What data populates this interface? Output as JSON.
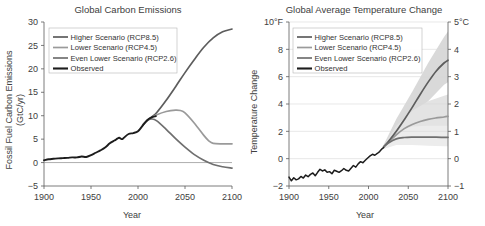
{
  "figure": {
    "panels": [
      {
        "id": "carbon-emissions",
        "title": "Global Carbon Emissions",
        "xlabel": "Year",
        "ylabel_line1": "Fossil Fuel Carbon Emissions",
        "ylabel_line2": "(GtC/yr)"
      },
      {
        "id": "temperature-change",
        "title": "Global Average Temperature Change",
        "xlabel": "Year",
        "ylabel_line1": "Temperature Change",
        "ylabel_line2": ""
      }
    ],
    "legend_entries": [
      {
        "label": "Higher Scenario (RCP8.5)",
        "color": "#5d5d5d"
      },
      {
        "label": "Lower Scenario (RCP4.5)",
        "color": "#9a9a9a"
      },
      {
        "label": "Even Lower Scenario (RCP2.6)",
        "color": "#6f6f6f"
      },
      {
        "label": "Observed",
        "color": "#1c1c1c"
      }
    ]
  },
  "chart_data": [
    {
      "type": "line",
      "id": "carbon-emissions",
      "title": "Global Carbon Emissions",
      "xlabel": "Year",
      "ylabel": "Fossil Fuel Carbon Emissions (GtC/yr)",
      "xlim": [
        1900,
        2100
      ],
      "ylim": [
        -5,
        30
      ],
      "xticks": [
        1900,
        1950,
        2000,
        2050,
        2100
      ],
      "yticks": [
        -5,
        0,
        5,
        10,
        15,
        20,
        25,
        30
      ],
      "ytick_labels": [
        "−5",
        "0",
        "5",
        "10",
        "15",
        "20",
        "25",
        "30"
      ],
      "grid": false,
      "legend_position": "top-left",
      "series": [
        {
          "name": "Observed",
          "color": "#1c1c1c",
          "width": 1.9,
          "x": [
            1900,
            1905,
            1910,
            1915,
            1920,
            1925,
            1930,
            1935,
            1940,
            1945,
            1950,
            1955,
            1960,
            1965,
            1970,
            1975,
            1978,
            1980,
            1983,
            1985,
            1990,
            1995,
            2000,
            2005,
            2010,
            2015,
            2019
          ],
          "y": [
            0.5,
            0.7,
            0.8,
            0.9,
            0.95,
            1.0,
            1.1,
            1.1,
            1.3,
            1.2,
            1.6,
            2.1,
            2.6,
            3.2,
            4.1,
            4.7,
            5.1,
            5.3,
            5.0,
            5.3,
            6.1,
            6.3,
            6.7,
            7.9,
            9.1,
            9.7,
            9.9
          ]
        },
        {
          "name": "Higher Scenario (RCP8.5)",
          "color": "#5d5d5d",
          "width": 1.7,
          "x": [
            2005,
            2010,
            2015,
            2020,
            2030,
            2040,
            2050,
            2060,
            2070,
            2080,
            2090,
            2100
          ],
          "y": [
            8.0,
            9.0,
            9.8,
            10.7,
            13.3,
            16.2,
            19.2,
            22.0,
            24.6,
            26.6,
            27.9,
            28.5
          ]
        },
        {
          "name": "Lower Scenario (RCP4.5)",
          "color": "#9a9a9a",
          "width": 1.7,
          "x": [
            2005,
            2010,
            2015,
            2020,
            2030,
            2040,
            2045,
            2050,
            2060,
            2070,
            2075,
            2080,
            2090,
            2100
          ],
          "y": [
            8.0,
            9.0,
            9.6,
            10.2,
            10.9,
            11.2,
            11.1,
            10.6,
            8.4,
            5.8,
            4.7,
            4.1,
            4.0,
            4.0
          ]
        },
        {
          "name": "Even Lower Scenario (RCP2.6)",
          "color": "#6f6f6f",
          "width": 1.7,
          "x": [
            2005,
            2010,
            2015,
            2020,
            2030,
            2040,
            2050,
            2060,
            2070,
            2080,
            2090,
            2100
          ],
          "y": [
            8.0,
            9.0,
            9.3,
            8.9,
            7.1,
            5.1,
            3.3,
            1.7,
            0.5,
            -0.4,
            -0.9,
            -1.2
          ]
        }
      ]
    },
    {
      "type": "line",
      "id": "temperature-change",
      "title": "Global Average Temperature Change",
      "xlabel": "Year",
      "ylabel": "Temperature Change",
      "xlim": [
        1900,
        2100
      ],
      "ylim_f": [
        -2,
        10
      ],
      "ylim_c": [
        -1,
        5
      ],
      "xticks": [
        1900,
        1950,
        2000,
        2050,
        2100
      ],
      "yticks_f": [
        -2,
        0,
        2,
        4,
        6,
        8,
        10
      ],
      "ytick_labels_f": [
        "−2",
        "0",
        "2",
        "4",
        "6",
        "8",
        "10°F"
      ],
      "yticks_c": [
        -1,
        0,
        1,
        2,
        3,
        4,
        5
      ],
      "ytick_labels_c": [
        "−1",
        "0",
        "1",
        "2",
        "3",
        "4",
        "5°C"
      ],
      "grid": true,
      "legend_position": "top-left",
      "series": [
        {
          "name": "Observed",
          "color": "#1c1c1c",
          "width": 1.5,
          "x": [
            1900,
            1903,
            1906,
            1909,
            1912,
            1915,
            1918,
            1921,
            1924,
            1927,
            1930,
            1933,
            1936,
            1939,
            1942,
            1945,
            1948,
            1951,
            1954,
            1957,
            1960,
            1963,
            1966,
            1969,
            1972,
            1975,
            1978,
            1981,
            1984,
            1987,
            1990,
            1993,
            1996,
            1999,
            2002,
            2005,
            2008,
            2011,
            2014,
            2017,
            2019
          ],
          "y": [
            -1.35,
            -1.62,
            -1.4,
            -1.55,
            -1.48,
            -1.3,
            -1.42,
            -1.2,
            -1.32,
            -1.15,
            -1.05,
            -1.25,
            -1.0,
            -0.78,
            -0.9,
            -0.82,
            -1.0,
            -0.95,
            -1.1,
            -0.85,
            -0.92,
            -1.0,
            -0.88,
            -0.72,
            -0.85,
            -0.9,
            -0.7,
            -0.5,
            -0.62,
            -0.38,
            -0.22,
            -0.3,
            -0.12,
            0.05,
            0.2,
            0.32,
            0.25,
            0.38,
            0.52,
            0.72,
            0.8
          ]
        },
        {
          "name": "Higher Scenario (RCP8.5)",
          "color": "#5d5d5d",
          "width": 1.7,
          "x": [
            2019,
            2025,
            2035,
            2045,
            2055,
            2065,
            2075,
            2085,
            2095,
            2100
          ],
          "y": [
            0.85,
            1.25,
            2.0,
            2.85,
            3.75,
            4.7,
            5.6,
            6.4,
            7.0,
            7.2
          ]
        },
        {
          "name": "Lower Scenario (RCP4.5)",
          "color": "#9a9a9a",
          "width": 1.7,
          "x": [
            2019,
            2025,
            2035,
            2045,
            2055,
            2065,
            2075,
            2085,
            2095,
            2100
          ],
          "y": [
            0.85,
            1.2,
            1.75,
            2.2,
            2.5,
            2.72,
            2.88,
            2.98,
            3.05,
            3.1
          ]
        },
        {
          "name": "Even Lower Scenario (RCP2.6)",
          "color": "#6f6f6f",
          "width": 1.7,
          "x": [
            2019,
            2025,
            2035,
            2045,
            2055,
            2065,
            2075,
            2085,
            2095,
            2100
          ],
          "y": [
            0.85,
            1.15,
            1.45,
            1.55,
            1.58,
            1.58,
            1.57,
            1.57,
            1.56,
            1.56
          ]
        }
      ],
      "uncertainty_bands": [
        {
          "name": "Higher Scenario (RCP8.5) range",
          "color": "#d9d9d9",
          "x": [
            2019,
            2035,
            2055,
            2075,
            2095,
            2100
          ],
          "upper": [
            1.0,
            2.9,
            4.9,
            7.0,
            8.9,
            9.3
          ],
          "lower": [
            0.7,
            1.5,
            2.7,
            4.2,
            5.4,
            5.6
          ]
        },
        {
          "name": "Lower Scenario (RCP4.5) range",
          "color": "#e3e3e3",
          "x": [
            2019,
            2035,
            2055,
            2075,
            2095,
            2100
          ],
          "upper": [
            0.95,
            2.4,
            3.5,
            4.2,
            4.6,
            4.7
          ],
          "lower": [
            0.72,
            1.25,
            1.7,
            1.95,
            2.0,
            2.0
          ]
        },
        {
          "name": "Even Lower Scenario (RCP2.6) range",
          "color": "#ececec",
          "x": [
            2019,
            2035,
            2055,
            2075,
            2095,
            2100
          ],
          "upper": [
            0.95,
            2.0,
            2.35,
            2.4,
            2.4,
            2.4
          ],
          "lower": [
            0.7,
            1.0,
            1.0,
            0.95,
            0.9,
            0.9
          ]
        }
      ]
    }
  ]
}
